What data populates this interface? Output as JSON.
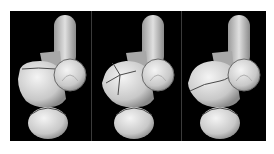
{
  "figure": {
    "background_color": "#000000",
    "bone_color": "#d8d8d8",
    "fracture_line_color": "#4a4a4a",
    "panels": [
      {
        "id": "panel-1",
        "fracture": "single transverse line across upper-left fragment"
      },
      {
        "id": "panel-2",
        "fracture": "multiple comminuted lines on left fragment"
      },
      {
        "id": "panel-3",
        "fracture": "oblique line across mid body"
      }
    ]
  }
}
